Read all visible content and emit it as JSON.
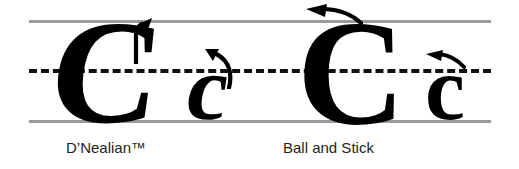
{
  "figure": {
    "background_color": "#ffffff",
    "ink_color": "#000000",
    "guide_line_color": "#9a9a9a",
    "midline_color": "#111111"
  },
  "guides": {
    "top_line_label": "top-line",
    "midline_label": "dashed-midline",
    "bottom_line_label": "baseline"
  },
  "styles": [
    {
      "caption": "D’Nealian™",
      "letters": [
        {
          "glyph": "C",
          "case": "uppercase",
          "slant": "slanted",
          "arrow": "up-left-curved-start-arrow"
        },
        {
          "glyph": "c",
          "case": "lowercase",
          "slant": "slanted",
          "arrow": "up-left-hooked-start-arrow"
        }
      ]
    },
    {
      "caption": "Ball and Stick",
      "letters": [
        {
          "glyph": "C",
          "case": "uppercase",
          "slant": "upright",
          "arrow": "left-pointing-start-arrow"
        },
        {
          "glyph": "c",
          "case": "lowercase",
          "slant": "upright",
          "arrow": "left-pointing-start-arrow"
        }
      ]
    }
  ]
}
